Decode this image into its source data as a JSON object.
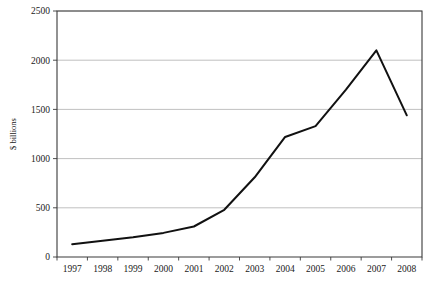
{
  "chart_data": {
    "type": "line",
    "title": "",
    "subtitle": "",
    "xlabel": "",
    "ylabel": "$ billions",
    "categories": [
      "1997",
      "1998",
      "1999",
      "2000",
      "2001",
      "2002",
      "2003",
      "2004",
      "2005",
      "2006",
      "2007",
      "2008"
    ],
    "x": [
      1997,
      1998,
      1999,
      2000,
      2001,
      2002,
      2003,
      2004,
      2005,
      2006,
      2007,
      2008
    ],
    "values": [
      130,
      165,
      200,
      245,
      310,
      480,
      810,
      1220,
      1330,
      1700,
      2100,
      1440
    ],
    "series": [
      {
        "name": "",
        "values": [
          130,
          165,
          200,
          245,
          310,
          480,
          810,
          1220,
          1330,
          1700,
          2100,
          1440
        ],
        "color": "#111111"
      }
    ],
    "ylim": [
      0,
      2500
    ],
    "yticks": [
      0,
      500,
      1000,
      1500,
      2000,
      2500
    ],
    "ytick_labels": [
      "0",
      "500",
      "1000",
      "1500",
      "2000",
      "2500"
    ],
    "xtick_labels": [
      "1997",
      "1998",
      "1999",
      "2000",
      "2001",
      "2002",
      "2003",
      "2004",
      "2005",
      "2006",
      "2007",
      "2008"
    ],
    "grid": true,
    "grid_axis": "y",
    "legend": false,
    "legend_position": "none",
    "annotations": [],
    "colors": {
      "line": "#111111",
      "grid": "#b0b0b0",
      "axis": "#3a3a3a",
      "background": "#ffffff",
      "text": "#1a1a1a"
    }
  },
  "layout": {
    "plot_left": 57,
    "plot_right": 422,
    "plot_top": 11,
    "plot_bottom": 257,
    "width": 439,
    "height": 287
  }
}
